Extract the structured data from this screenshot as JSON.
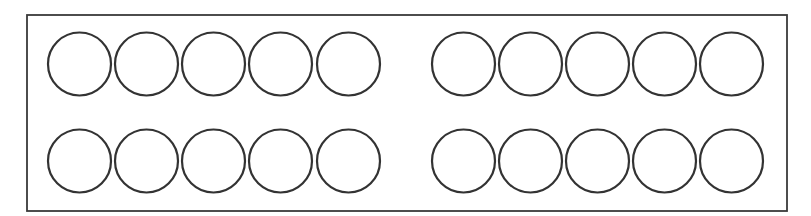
{
  "diagram": {
    "canvas": {
      "width": 811,
      "height": 216,
      "background_color": "#ffffff"
    },
    "frame": {
      "name": "outer-rectangle",
      "x": 27,
      "y": 15,
      "width": 760,
      "height": 196,
      "stroke_color": "#3a3a3a",
      "stroke_width": 1.8,
      "fill": "none"
    },
    "counters": {
      "total_count": 20,
      "row_count": 2,
      "groups_per_row": 2,
      "circles_per_group": 5,
      "diameter": 63,
      "radius": 31.5,
      "stroke_color": "#333333",
      "stroke_width": 2.2,
      "fill": "none",
      "row_centers_y": [
        64,
        161
      ],
      "group_pitch_x": 67,
      "group_start_x": [
        79.5,
        463.5
      ],
      "group_gap": 47
    },
    "rows": [
      {
        "name": "top-row",
        "center_y": 64,
        "groups": [
          {
            "name": "top-row-left-group",
            "count": 5,
            "centers_x": [
              79.5,
              146.5,
              213.5,
              280.5,
              348.5
            ]
          },
          {
            "name": "top-row-right-group",
            "count": 5,
            "centers_x": [
              463.5,
              530.5,
              597.5,
              664.5,
              731.5
            ]
          }
        ]
      },
      {
        "name": "bottom-row",
        "center_y": 161,
        "groups": [
          {
            "name": "bottom-row-left-group",
            "count": 5,
            "centers_x": [
              79.5,
              146.5,
              213.5,
              280.5,
              348.5
            ]
          },
          {
            "name": "bottom-row-right-group",
            "count": 5,
            "centers_x": [
              463.5,
              530.5,
              597.5,
              664.5,
              731.5
            ]
          }
        ]
      }
    ]
  }
}
